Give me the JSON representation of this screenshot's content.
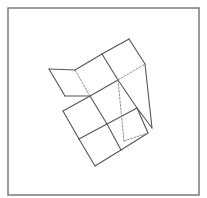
{
  "figure": {
    "kind": "unfolded-cube-net-with-fold",
    "width": 207,
    "height": 198,
    "colors": {
      "background": "#ffffff",
      "frame": "#7a7a7a",
      "solid_line": "#555555",
      "dashed_line": "#8a8a8a"
    },
    "frame": {
      "x": 8,
      "y": 8,
      "w": 191,
      "h": 187
    },
    "solid_segments": [
      [
        49,
        69,
        75,
        70
      ],
      [
        49,
        69,
        65,
        96
      ],
      [
        65,
        96,
        90,
        96
      ],
      [
        75,
        70,
        102,
        54
      ],
      [
        102,
        54,
        129,
        39
      ],
      [
        129,
        39,
        145,
        64
      ],
      [
        145,
        64,
        152,
        128
      ],
      [
        102,
        54,
        118,
        80
      ],
      [
        90,
        96,
        118,
        80
      ],
      [
        118,
        80,
        137,
        108
      ],
      [
        90,
        96,
        63,
        111
      ],
      [
        90,
        96,
        107,
        124
      ],
      [
        107,
        124,
        137,
        108
      ],
      [
        63,
        111,
        79,
        139
      ],
      [
        79,
        139,
        107,
        124
      ],
      [
        107,
        124,
        121,
        150
      ],
      [
        137,
        108,
        148,
        133
      ],
      [
        148,
        133,
        121,
        150
      ],
      [
        79,
        139,
        95,
        166
      ],
      [
        95,
        166,
        121,
        150
      ],
      [
        137,
        108,
        152,
        128
      ]
    ],
    "dashed_segments": [
      [
        75,
        70,
        90,
        96
      ],
      [
        118,
        80,
        145,
        64
      ],
      [
        118,
        80,
        124,
        141
      ],
      [
        124,
        141,
        148,
        133
      ]
    ]
  }
}
